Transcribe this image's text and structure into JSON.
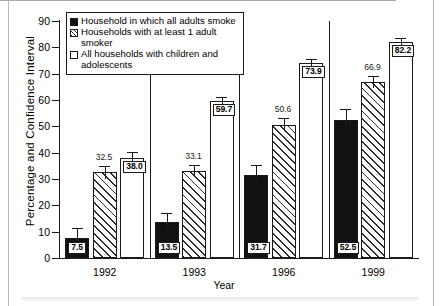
{
  "figure": {
    "ylabel": "Percentage and Confidence Interval",
    "xlabel": "Year"
  },
  "legend": {
    "items": [
      {
        "key": "black",
        "swatch": "filled-black-square",
        "label": "Household in which all adults smoke"
      },
      {
        "key": "hatch",
        "swatch": "hatched-square",
        "label": "Households with at least 1 adult smoker"
      },
      {
        "key": "white",
        "swatch": "open-white-square",
        "label": "All households with children and adolescents"
      }
    ]
  },
  "axis": {
    "y_ticks": [
      "0",
      "10",
      "20",
      "30",
      "40",
      "50",
      "60",
      "70",
      "80",
      "90"
    ],
    "x_ticks": [
      "1992",
      "1993",
      "1996",
      "1999"
    ]
  },
  "chart_data": {
    "type": "bar",
    "title": "",
    "xlabel": "Year",
    "ylabel": "Percentage and Confidence Interval",
    "ylim": [
      0,
      90
    ],
    "ytick_step": 10,
    "grid": false,
    "legend_position": "top-left",
    "categories": [
      "1992",
      "1993",
      "1996",
      "1999"
    ],
    "series": [
      {
        "name": "Household in which all adults smoke",
        "fill": "black",
        "values": [
          7.5,
          13.5,
          31.7,
          52.5
        ],
        "labels": [
          "7.5",
          "13.5",
          "31.7",
          "52.5"
        ],
        "label_style": "boxed-inside-bar",
        "ci_low": [
          3.6,
          10.0,
          28.0,
          48.5
        ],
        "ci_high": [
          11.4,
          17.0,
          35.4,
          56.5
        ]
      },
      {
        "name": "Households with at least 1 adult smoker",
        "fill": "hatch",
        "values": [
          32.5,
          33.1,
          50.6,
          66.9
        ],
        "labels": [
          "32.5",
          "33.1",
          "50.6",
          "66.9"
        ],
        "label_style": "above-bar",
        "ci_low": [
          30.0,
          31.0,
          48.2,
          64.7
        ],
        "ci_high": [
          35.0,
          35.2,
          53.0,
          69.1
        ]
      },
      {
        "name": "All households with children and adolescents",
        "fill": "white",
        "values": [
          38.0,
          59.7,
          73.9,
          82.2
        ],
        "labels": [
          "38.0",
          "59.7",
          "73.9",
          "82.2"
        ],
        "label_style": "boxed-inside-top",
        "ci_low": [
          35.6,
          58.3,
          72.4,
          81.0
        ],
        "ci_high": [
          40.4,
          61.1,
          75.4,
          83.4
        ]
      }
    ]
  }
}
